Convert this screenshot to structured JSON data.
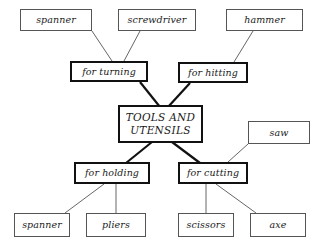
{
  "diagram": {
    "title": "TOOLS AND UTENSILS",
    "type": "concept-map",
    "root": {
      "id": "root",
      "line1": "TOOLS AND",
      "line2": "UTENSILS"
    },
    "categories": [
      {
        "id": "for-turning",
        "label": "for turning"
      },
      {
        "id": "for-hitting",
        "label": "for hitting"
      },
      {
        "id": "for-holding",
        "label": "for holding"
      },
      {
        "id": "for-cutting",
        "label": "for cutting"
      }
    ],
    "items": [
      {
        "id": "spanner-top",
        "label": "spanner",
        "parent": "for-turning"
      },
      {
        "id": "screwdriver",
        "label": "screwdriver",
        "parent": "for-turning"
      },
      {
        "id": "hammer",
        "label": "hammer",
        "parent": "for-hitting"
      },
      {
        "id": "saw",
        "label": "saw",
        "parent": "for-cutting"
      },
      {
        "id": "spanner-bottom",
        "label": "spanner",
        "parent": "for-holding"
      },
      {
        "id": "pliers",
        "label": "pliers",
        "parent": "for-holding"
      },
      {
        "id": "scissors",
        "label": "scissors",
        "parent": "for-cutting"
      },
      {
        "id": "axe",
        "label": "axe",
        "parent": "for-cutting"
      }
    ],
    "colors": {
      "background": "#ffffff",
      "leaf_border": "#555555",
      "category_border": "#111111",
      "thin_link": "#666666",
      "thick_link": "#111111",
      "text": "#1a1a1a"
    }
  }
}
